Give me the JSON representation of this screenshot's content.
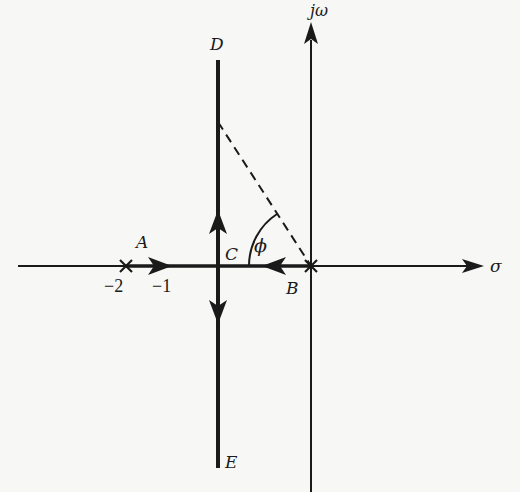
{
  "diagram": {
    "type": "root-locus",
    "colors": {
      "ink": "#1a1a1a",
      "background": "#f7f7f5"
    },
    "axes": {
      "real_axis_label": "σ",
      "imag_axis_label": "jω"
    },
    "points": {
      "A": {
        "label": "A",
        "tick_label": "−2",
        "marker": "x-pole"
      },
      "B": {
        "label": "B",
        "marker": "x-pole"
      },
      "C": {
        "label": "C"
      },
      "D": {
        "label": "D"
      },
      "E": {
        "label": "E"
      }
    },
    "ticks": {
      "minus_two": "−2",
      "minus_one": "−1"
    },
    "angle": {
      "label": "ϕ"
    },
    "paths": [
      {
        "from": "A",
        "to": "C",
        "direction": "right"
      },
      {
        "from": "B",
        "to": "C",
        "direction": "left"
      },
      {
        "from": "C",
        "to": "D",
        "direction": "up"
      },
      {
        "from": "C",
        "to": "E",
        "direction": "down"
      }
    ]
  }
}
